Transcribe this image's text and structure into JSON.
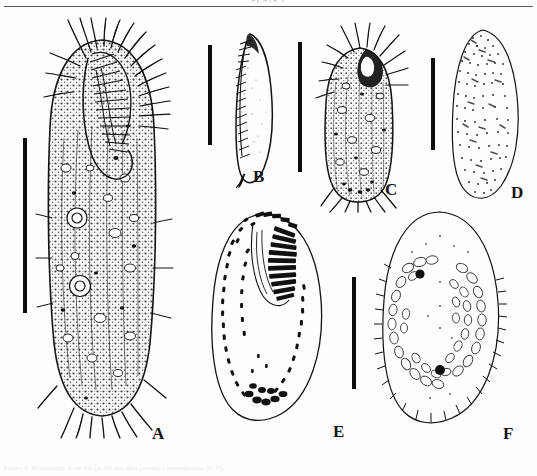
{
  "document": {
    "running_head": "PLATE 1",
    "figure_caption": "Figure 1. Morphology from life (A-D) and after protargol impregnation (E, F)."
  },
  "figure": {
    "type": "scientific-plate",
    "panel_count": 6,
    "panels": [
      {
        "id": "A",
        "label": "A",
        "label_x": 152,
        "label_y": 424,
        "description": "ventral view of whole cell from life, dense cortical granules, frontal and caudal cirri",
        "view": "ventral",
        "has_scale_bar": true
      },
      {
        "id": "B",
        "label": "B",
        "label_x": 253,
        "label_y": 167,
        "description": "lateral view of cell showing body outline and adoral zone",
        "view": "lateral",
        "has_scale_bar": true
      },
      {
        "id": "C",
        "label": "C",
        "label_x": 385,
        "label_y": 180,
        "description": "dorsal view of cell with cortical granules and caudal cirri",
        "view": "dorsal",
        "has_scale_bar": true
      },
      {
        "id": "D",
        "label": "D",
        "label_x": 511,
        "label_y": 183,
        "description": "outline of cell showing distribution of cortical granules",
        "view": "outline",
        "has_scale_bar": true
      },
      {
        "id": "E",
        "label": "E",
        "label_x": 333,
        "label_y": 422,
        "description": "ventral infraciliature after protargol impregnation, adoral zone of membranelles and cirral rows",
        "view": "ventral-infraciliature",
        "has_scale_bar": true
      },
      {
        "id": "F",
        "label": "F",
        "label_x": 503,
        "label_y": 424,
        "description": "dorsal infraciliature with macronuclear nodules and micronuclei",
        "view": "dorsal-infraciliature",
        "has_scale_bar": false
      }
    ],
    "scale_bars": [
      {
        "id": "scale-bar-a",
        "x": 23,
        "y": 138,
        "height": 175
      },
      {
        "id": "scale-bar-b",
        "x": 208,
        "y": 45,
        "height": 100
      },
      {
        "id": "scale-bar-c",
        "x": 298,
        "y": 42,
        "height": 130
      },
      {
        "id": "scale-bar-d",
        "x": 431,
        "y": 58,
        "height": 92
      },
      {
        "id": "scale-bar-e",
        "x": 352,
        "y": 277,
        "height": 112
      }
    ]
  },
  "colors": {
    "ink": "#111111",
    "rule": "#5a5a5a",
    "paper": "#fdfdfd",
    "faint_text": "#b9b9b9"
  }
}
